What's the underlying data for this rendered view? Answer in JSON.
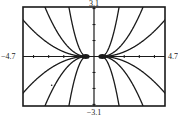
{
  "chart_data": {
    "type": "line",
    "title": "",
    "xlabel": "",
    "ylabel": "",
    "window": {
      "xmin": -4.7,
      "xmax": 4.7,
      "ymin": -3.1,
      "ymax": 3.1,
      "xscl": 1,
      "yscl": 1
    },
    "xlim": [
      -4.7,
      4.7
    ],
    "ylim": [
      -3.1,
      3.1
    ],
    "grid": false,
    "legend": null,
    "tick_labels": {
      "xmin": "−4.7",
      "xmax": "4.7",
      "ymin": "−3.1",
      "ymax": "3.1"
    },
    "series": [
      {
        "name": "C=2.3",
        "x0": 0.5,
        "c": 2.3
      },
      {
        "name": "C=0.41",
        "x0": 0.5,
        "c": 0.41
      },
      {
        "name": "C=0.13",
        "x0": 0.5,
        "c": 0.13
      }
    ],
    "stray_points": [
      {
        "x": -2.8,
        "y": -1.8
      }
    ]
  },
  "frame": {
    "left": 23,
    "top": 7,
    "right": 165,
    "bottom": 106
  },
  "colors": {
    "curve": "#1a1a1a",
    "axis": "#1a1a1a",
    "frame": "#1a1a1a",
    "background": "#ffffff"
  }
}
